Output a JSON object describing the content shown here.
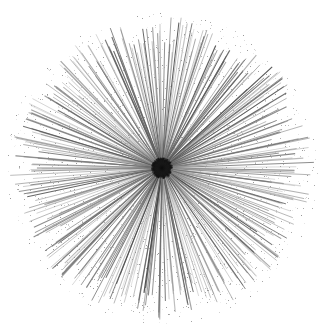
{
  "figure": {
    "alt_text": "A dense starburst of several hundred thin gray straight lines radiating outward from a single dark convergence point, forming a ragged circular silhouette on a white background.",
    "domain": "Natural-Image"
  },
  "canvas": {
    "width": 327,
    "height": 334,
    "background_color": "#ffffff"
  },
  "chart_data": {
    "type": "scatter",
    "subtitle": "",
    "xlabel": "",
    "ylabel": "",
    "grid": false,
    "legend_position": "none",
    "xlim": [
      0,
      327
    ],
    "ylim": [
      0,
      334
    ],
    "axis_visible": false,
    "tick_labels_x": [],
    "tick_labels_y": [],
    "legend_entries": [],
    "annotations": [],
    "geometry": {
      "center_x": 162,
      "center_y": 168,
      "ray_count": 300,
      "radius_mean": 141,
      "radius_min": 112,
      "radius_max": 152,
      "inner_radius": 1,
      "extent_left_x": 16,
      "extent_right_x": 312,
      "extent_top_y": 19,
      "extent_bottom_y": 318,
      "core_radius": 11
    },
    "style": {
      "line_color_dark": "#3c3c3c",
      "line_color_mid": "#6b6b6b",
      "line_color_light": "#9a9a9a",
      "line_width_min": 0.55,
      "line_width_max": 1.25,
      "opacity_min": 0.35,
      "opacity_max": 0.95,
      "core_color": "#141414",
      "noise_amount": 0.055,
      "noise_color": "#bdbdbd"
    },
    "angular_clusters": [
      {
        "angle_deg": 0,
        "weight": 1.35
      },
      {
        "angle_deg": 90,
        "weight": 1.25
      },
      {
        "angle_deg": 180,
        "weight": 1.3
      },
      {
        "angle_deg": 270,
        "weight": 1.2
      },
      {
        "angle_deg": 45,
        "weight": 1.1
      },
      {
        "angle_deg": 135,
        "weight": 1.05
      },
      {
        "angle_deg": 225,
        "weight": 1.1
      },
      {
        "angle_deg": 315,
        "weight": 1.05
      }
    ],
    "random_seed": 20240517
  }
}
